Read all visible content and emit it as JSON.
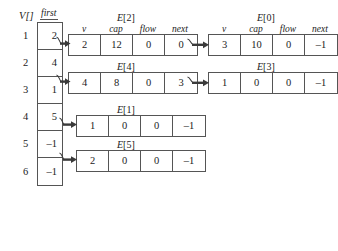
{
  "figure": {
    "vertex_array": {
      "name": "V[]",
      "pointer_field": "first",
      "rows": [
        {
          "index": "1",
          "first": "2"
        },
        {
          "index": "2",
          "first": "4"
        },
        {
          "index": "3",
          "first": "1"
        },
        {
          "index": "4",
          "first": "5"
        },
        {
          "index": "5",
          "first": "–1"
        },
        {
          "index": "6",
          "first": "–1"
        }
      ]
    },
    "column_headers": [
      "v",
      "cap",
      "flow",
      "next"
    ],
    "edge_records": [
      {
        "title_prefix": "E",
        "title_index": "[2]",
        "v": "2",
        "cap": "12",
        "flow": "0",
        "next": "0"
      },
      {
        "title_prefix": "E",
        "title_index": "[0]",
        "v": "3",
        "cap": "10",
        "flow": "0",
        "next": "–1"
      },
      {
        "title_prefix": "E",
        "title_index": "[4]",
        "v": "4",
        "cap": "8",
        "flow": "0",
        "next": "3"
      },
      {
        "title_prefix": "E",
        "title_index": "[3]",
        "v": "1",
        "cap": "0",
        "flow": "0",
        "next": "–1"
      },
      {
        "title_prefix": "E",
        "title_index": "[1]",
        "v": "1",
        "cap": "0",
        "flow": "0",
        "next": "–1"
      },
      {
        "title_prefix": "E",
        "title_index": "[5]",
        "v": "2",
        "cap": "0",
        "flow": "0",
        "next": "–1"
      }
    ],
    "colors": {
      "stroke": "#555555",
      "arrow": "#3a3a3a",
      "text": "#1b1b1b",
      "background": "#ffffff"
    }
  }
}
